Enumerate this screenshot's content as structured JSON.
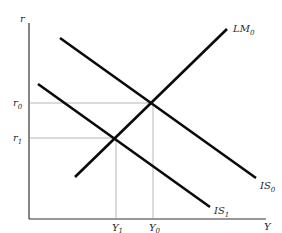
{
  "diagram": {
    "type": "IS-LM",
    "axes": {
      "y_label": "r",
      "x_label": "Y"
    },
    "curves": [
      {
        "id": "LM0",
        "label_main": "LM",
        "label_sub": "0",
        "x1": 75,
        "y1": 177,
        "x2": 227,
        "y2": 29,
        "label_x": 233,
        "label_y": 32
      },
      {
        "id": "IS0",
        "label_main": "IS",
        "label_sub": "0",
        "x1": 60,
        "y1": 38,
        "x2": 256,
        "y2": 178,
        "label_x": 260,
        "label_y": 189
      },
      {
        "id": "IS1",
        "label_main": "IS",
        "label_sub": "1",
        "x1": 38,
        "y1": 84,
        "x2": 210,
        "y2": 207,
        "label_x": 214,
        "label_y": 214
      }
    ],
    "equilibria": [
      {
        "id": "E0",
        "r_label": "r",
        "r_sub": "0",
        "Y_label": "Y",
        "Y_sub": "0",
        "x": 153,
        "y": 103
      },
      {
        "id": "E1",
        "r_label": "r",
        "r_sub": "1",
        "Y_label": "Y",
        "Y_sub": "1",
        "x": 116,
        "y": 138
      }
    ],
    "colors": {
      "curve": "#0a0a0a",
      "axis": "#333333",
      "guide": "#9a9a9a",
      "text": "#2a2a2a"
    }
  }
}
